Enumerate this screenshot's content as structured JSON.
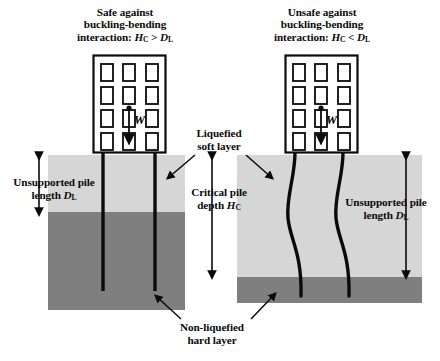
{
  "figure": {
    "width": 440,
    "height": 361,
    "background": "#ffffff"
  },
  "colors": {
    "soft_layer": "#d6d6d6",
    "hard_layer": "#7f7f7f",
    "line": "#0b0b0b",
    "building_fill": "#ffffff",
    "text": "#0b0b0b"
  },
  "panels": {
    "left": {
      "title": {
        "line1": "Safe against",
        "line2": "buckling-bending",
        "line3_prefix": "interaction: ",
        "line3_sym1": "H",
        "line3_sub1": "C",
        "line3_rel": " > ",
        "line3_sym2": "D",
        "line3_sub2": "L"
      },
      "pile_state": "straight",
      "building": {
        "window_rows": 4,
        "window_cols": 3,
        "load_label": "W"
      },
      "annotation": {
        "line1": "Unsupported pile",
        "line2_prefix": "length ",
        "line2_sym": "D",
        "line2_sub": "L"
      }
    },
    "right": {
      "title": {
        "line1": "Unsafe against",
        "line2": "buckling-bending",
        "line3_prefix": "interaction: ",
        "line3_sym1": "H",
        "line3_sub1": "C",
        "line3_rel": " < ",
        "line3_sym2": "D",
        "line3_sub2": "L"
      },
      "pile_state": "buckled",
      "building": {
        "window_rows": 4,
        "window_cols": 3,
        "load_label": "W"
      },
      "annotation": {
        "line1": "Unsupported pile",
        "line2_prefix": "length ",
        "line2_sym": "D",
        "line2_sub": "L"
      }
    }
  },
  "labels": {
    "liquefied": {
      "line1": "Liquefied",
      "line2": "soft layer"
    },
    "critical": {
      "line1": "Critical pile",
      "line2_prefix": "depth ",
      "line2_sym": "H",
      "line2_sub": "C"
    },
    "nonliquefied": {
      "line1": "Non-liquefied",
      "line2": "hard layer"
    }
  }
}
